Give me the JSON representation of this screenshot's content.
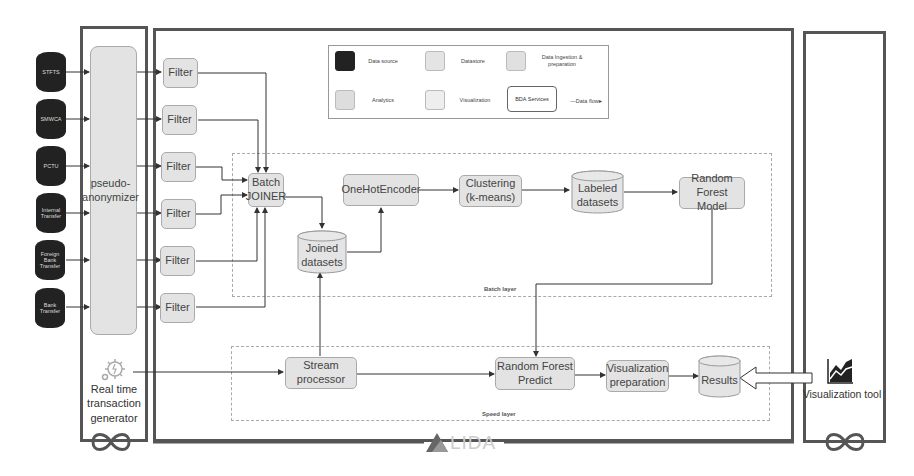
{
  "legend": {
    "items": [
      {
        "label": "Data source",
        "color": "#222222"
      },
      {
        "label": "Datastore",
        "color": "#e4e4e4"
      },
      {
        "label": "Data Ingestion & preparation",
        "color": "#e0e0e0"
      },
      {
        "label": "Analytics",
        "color": "#dddddd"
      },
      {
        "label": "Visualization",
        "color": "#eeeeee"
      },
      {
        "label": "BDA Services",
        "color": "#ffffff"
      },
      {
        "label": "—Data flow▸",
        "color": ""
      }
    ]
  },
  "sources": [
    {
      "label": "STFTS"
    },
    {
      "label": "SMWCA"
    },
    {
      "label": "PCTU"
    },
    {
      "label": "Internal Transfer"
    },
    {
      "label": "Foreign Bank Transfer"
    },
    {
      "label": "Bank Transfer"
    }
  ],
  "ingestion": {
    "anonymizer": "pseudo-anonymizer",
    "generator": "Real time transaction generator",
    "filters": [
      "Filter",
      "Filter",
      "Filter",
      "Filter",
      "Filter",
      "Filter"
    ]
  },
  "batch_layer": {
    "label": "Batch layer",
    "joiner": "Batch JOINER",
    "joined": "Joined datasets",
    "encoder": "OneHotEncoder",
    "clustering": "Clustering (k-means)",
    "labeled": "Labeled datasets",
    "model": "Random Forest Model"
  },
  "speed_layer": {
    "label": "Speed layer",
    "stream": "Stream processor",
    "predict": "Random Forest Predict",
    "vizprep": "Visualization preparation",
    "results": "Results"
  },
  "viz": {
    "tool": "Visualization tool"
  },
  "brand": {
    "logo_text": "LIDA"
  }
}
